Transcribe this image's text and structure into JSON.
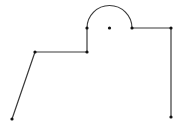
{
  "diagram": {
    "type": "geometric-polyline-with-arc",
    "width": 183,
    "height": 132,
    "stroke_color": "#3a3a3a",
    "point_color": "#111111",
    "background": "#ffffff",
    "points": [
      {
        "id": "p1",
        "x": 12,
        "y": 119
      },
      {
        "id": "p2",
        "x": 35,
        "y": 52
      },
      {
        "id": "p3",
        "x": 87,
        "y": 52
      },
      {
        "id": "p4",
        "x": 87,
        "y": 28
      },
      {
        "id": "p5",
        "x": 132,
        "y": 28
      },
      {
        "id": "p6",
        "x": 171,
        "y": 28
      },
      {
        "id": "p7",
        "x": 171,
        "y": 117
      }
    ],
    "center_point": {
      "id": "c",
      "x": 109.5,
      "y": 28
    },
    "segments": [
      {
        "from": "p1",
        "to": "p2",
        "kind": "line"
      },
      {
        "from": "p2",
        "to": "p3",
        "kind": "line"
      },
      {
        "from": "p3",
        "to": "p4",
        "kind": "line"
      },
      {
        "from": "p4",
        "to": "p5",
        "kind": "semicircle-arc",
        "center": "c",
        "radius": 22.5
      },
      {
        "from": "p5",
        "to": "p6",
        "kind": "line"
      },
      {
        "from": "p6",
        "to": "p7",
        "kind": "line"
      }
    ]
  }
}
